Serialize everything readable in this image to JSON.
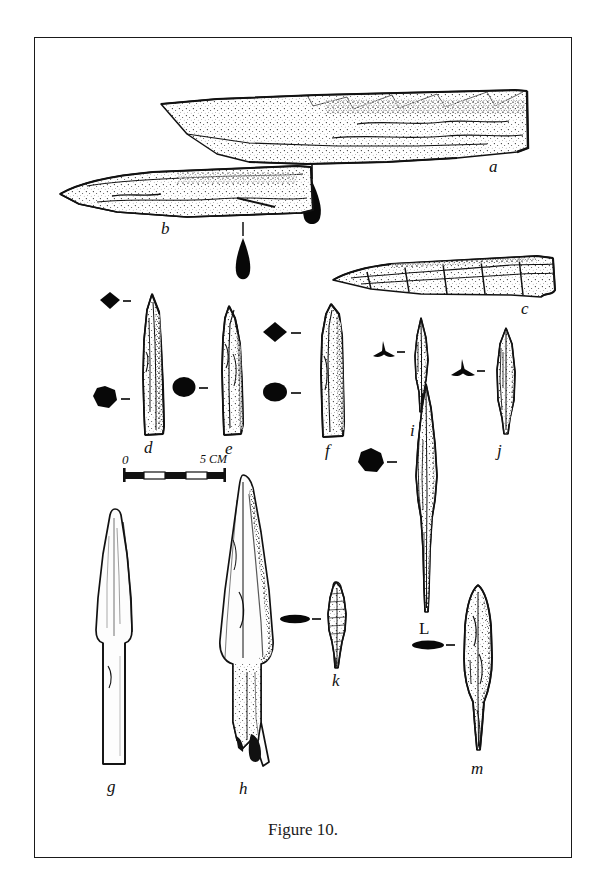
{
  "plate": {
    "caption": "Figure 10.",
    "ink_color": "#111111",
    "border_color": "#1a1a1a",
    "background_color": "#ffffff"
  },
  "scale_bar": {
    "min_label": "0",
    "max_label": "5 CM",
    "segments": 5,
    "unit": "CM"
  },
  "artifacts": [
    {
      "label": "a",
      "kind": "long-blade-fragment",
      "cross_section": "teardrop"
    },
    {
      "label": "b",
      "kind": "tapered-blade",
      "cross_section": "teardrop"
    },
    {
      "label": "c",
      "kind": "tapered-blade-fragment",
      "cross_section": "none"
    },
    {
      "label": "d",
      "kind": "socketed-point",
      "cross_section": "diamond-and-octagon"
    },
    {
      "label": "e",
      "kind": "socketed-point",
      "cross_section": "ellipse-and-ellipse"
    },
    {
      "label": "f",
      "kind": "socketed-point",
      "cross_section": "diamond-and-ellipse"
    },
    {
      "label": "g",
      "kind": "tanged-spearhead",
      "cross_section": "none"
    },
    {
      "label": "h",
      "kind": "tanged-spearhead",
      "cross_section": "none"
    },
    {
      "label": "i",
      "kind": "trilobate-arrowhead",
      "cross_section": "trilobate"
    },
    {
      "label": "j",
      "kind": "trilobate-arrowhead",
      "cross_section": "trilobate"
    },
    {
      "label": "k",
      "kind": "small-barbed-point",
      "cross_section": "flat-lenticular"
    },
    {
      "label": "L",
      "kind": "long-tanged-point",
      "cross_section": "octagon"
    },
    {
      "label": "m",
      "kind": "leaf-shaped-blade",
      "cross_section": "flat-lenticular"
    }
  ]
}
